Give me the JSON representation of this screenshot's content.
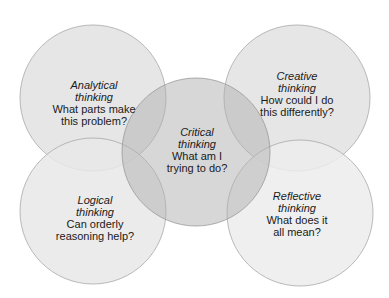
{
  "diagram": {
    "circles": [
      {
        "id": "analytical",
        "title_line1": "Analytical",
        "title_line2": "thinking",
        "q_line1": "What parts make",
        "q_line2": "this problem?"
      },
      {
        "id": "creative",
        "title_line1": "Creative",
        "title_line2": "thinking",
        "q_line1": "How could I do",
        "q_line2": "this differently?"
      },
      {
        "id": "critical",
        "title_line1": "Critical",
        "title_line2": "thinking",
        "q_line1": "What am I",
        "q_line2": "trying to do?"
      },
      {
        "id": "logical",
        "title_line1": "Logical",
        "title_line2": "thinking",
        "q_line1": "Can orderly",
        "q_line2": "reasoning help?"
      },
      {
        "id": "reflective",
        "title_line1": "Reflective",
        "title_line2": "thinking",
        "q_line1": "What does it",
        "q_line2": "all mean?"
      }
    ],
    "colors": {
      "outer_fill": "#e4e4e4",
      "center_fill": "#c8c8c8",
      "stroke": "#a8a8a8",
      "text": "#1a1a1a"
    }
  }
}
